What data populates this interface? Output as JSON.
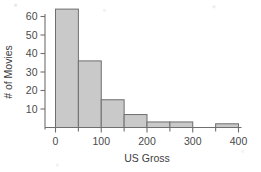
{
  "chart_data": {
    "type": "bar",
    "title": "",
    "subtitle": "",
    "xlabel": "US Gross",
    "ylabel": "# of Movies",
    "grid": false,
    "legend": "none",
    "histogram": true,
    "bin_width": 50,
    "bin_edges": [
      0,
      50,
      100,
      150,
      200,
      250,
      300,
      350,
      400
    ],
    "categories": [
      "0-50",
      "50-100",
      "100-150",
      "150-200",
      "200-250",
      "250-300",
      "300-350",
      "350-400"
    ],
    "values": [
      64,
      36,
      15,
      7,
      3,
      3,
      0,
      2
    ],
    "xlim": [
      -20,
      410
    ],
    "ylim": [
      0,
      68
    ],
    "xticks": [
      0,
      100,
      200,
      300,
      400
    ],
    "xtick_labels": [
      "0",
      "100",
      "200",
      "300",
      "400"
    ],
    "xminor_ticks": [
      50,
      150,
      250,
      350
    ],
    "yticks": [
      10,
      20,
      30,
      40,
      50,
      60
    ],
    "ytick_labels": [
      "10",
      "20",
      "30",
      "40",
      "50",
      "60"
    ],
    "bar_fill_color": "#c9c9c9",
    "bar_edge_color": "#6e6e6e",
    "axis_color": "#6f6f6f",
    "text_color": "#3d3d3d"
  },
  "axes": {
    "x_title": "US Gross",
    "y_title": "# of Movies"
  }
}
